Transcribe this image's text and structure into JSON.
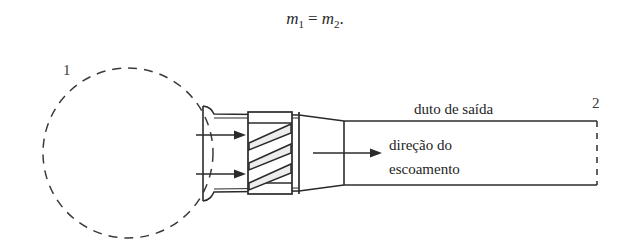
{
  "equation": {
    "lhs_symbol": "m",
    "lhs_subscript": "1",
    "operator": "=",
    "rhs_symbol": "m",
    "rhs_subscript": "2",
    "terminator": ".",
    "full_text": "ṁ1 = ṁ2."
  },
  "diagram": {
    "labels": {
      "station_1": "1",
      "station_2": "2",
      "outlet_duct": "duto de saída",
      "flow_direction_line1": "direção do",
      "flow_direction_line2": "escoamento"
    },
    "colors": {
      "stroke": "#2b2b2b",
      "dashed_stroke": "#3a3a3a",
      "blade_fill": "#ededed",
      "background": "#ffffff"
    },
    "elements": {
      "control_surface_circle": "dashed-circle",
      "inlet_arrows": 2,
      "outlet_arrow": 1,
      "fan_blades": 3,
      "duct_end": "dashed-vertical-line"
    }
  }
}
